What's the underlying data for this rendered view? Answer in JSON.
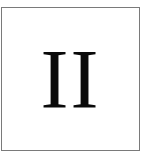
{
  "tile": {
    "label": "II",
    "border_color": "#7a7a7a",
    "text_color": "#0a0a0a",
    "background_color": "#ffffff"
  }
}
